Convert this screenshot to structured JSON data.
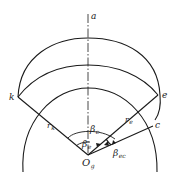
{
  "diagram": {
    "title": "",
    "points": {
      "a": {
        "label": "a"
      },
      "k": {
        "label": "k"
      },
      "e": {
        "label": "e"
      },
      "c": {
        "label": "c"
      },
      "O": {
        "label": "O",
        "sub": "g"
      }
    },
    "radii": {
      "rk": {
        "label": "r",
        "sub": "k"
      },
      "re": {
        "label": "r",
        "sub": "e"
      }
    },
    "angles": {
      "beta_c": {
        "label": "β",
        "sub": "c"
      },
      "beta_e": {
        "label": "β",
        "sub": "e"
      },
      "beta_ec": {
        "label": "β",
        "sub": "ec"
      }
    },
    "colors": {
      "stroke": "#1a1a1a",
      "background": "#ffffff"
    }
  }
}
